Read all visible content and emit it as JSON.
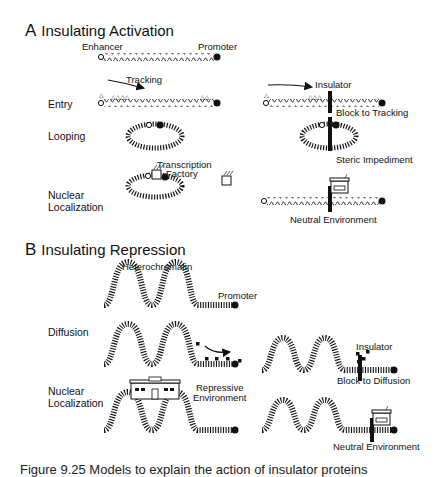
{
  "section_a": {
    "letter": "A",
    "title": "Insulating Activation",
    "labels": {
      "enhancer": "Enhancer",
      "promoter": "Promoter",
      "tracking": "Tracking",
      "insulator": "Insulator",
      "block_to_tracking": "Block to Tracking",
      "steric_impediment": "Steric Impediment",
      "transcription_factory_line1": "Transcription",
      "transcription_factory_line2": "Factory",
      "neutral_environment": "Neutral Environment"
    },
    "rows": [
      {
        "label": "Entry"
      },
      {
        "label": "Looping"
      },
      {
        "label_line1": "Nuclear",
        "label_line2": "Localization"
      }
    ]
  },
  "section_b": {
    "letter": "B",
    "title": "Insulating Repression",
    "labels": {
      "heterochromatin": "Heterochromatin",
      "promoter": "Promoter",
      "insulator": "Insulator",
      "block_to_diffusion": "Block to Diffusion",
      "repressive_environment_line1": "Repressive",
      "repressive_environment_line2": "Environment",
      "neutral_environment": "Neutral Environment"
    },
    "rows": [
      {
        "label": "Diffusion"
      },
      {
        "label_line1": "Nuclear",
        "label_line2": "Localization"
      }
    ]
  },
  "caption": {
    "text": "Figure 9.25   Models to explain the action of insulator proteins"
  },
  "colors": {
    "ink": "#111111",
    "background": "#ffffff"
  }
}
